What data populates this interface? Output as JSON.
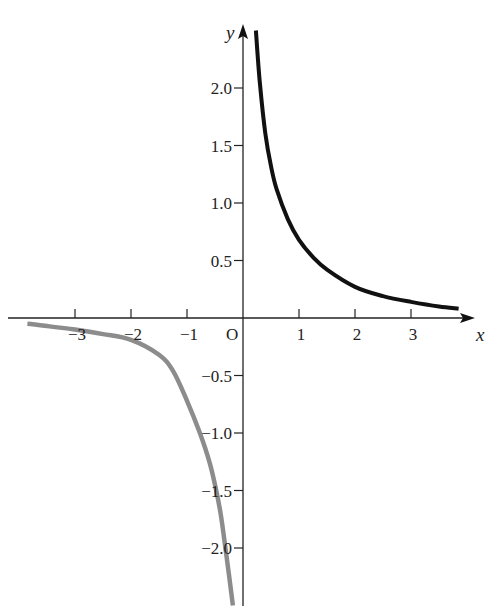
{
  "chart_data": {
    "type": "line",
    "title": "",
    "xlabel": "x",
    "ylabel": "y",
    "origin_label": "O",
    "xlim": [
      -4.3,
      4.3
    ],
    "ylim": [
      -2.5,
      2.5
    ],
    "grid": false,
    "legend": "none",
    "x_ticks": [
      -3,
      -2,
      -1,
      1,
      2,
      3
    ],
    "x_tick_labels": [
      "−3",
      "−2",
      "−1",
      "1",
      "2",
      "3"
    ],
    "y_ticks": [
      2.0,
      1.5,
      1.0,
      0.5,
      -0.5,
      -1.0,
      -1.5,
      -2.0
    ],
    "y_tick_labels": [
      "2.0",
      "1.5",
      "1.0",
      "0.5",
      "−0.5",
      "−1.0",
      "−1.5",
      "−2.0"
    ],
    "series": [
      {
        "name": "positive branch",
        "color": "#111111",
        "x": [
          0.23,
          0.3,
          0.4,
          0.5,
          0.6,
          0.8,
          1.0,
          1.25,
          1.5,
          2.0,
          2.5,
          3.0,
          3.5,
          3.85
        ],
        "y": [
          2.5,
          2.05,
          1.6,
          1.32,
          1.12,
          0.86,
          0.68,
          0.53,
          0.42,
          0.27,
          0.19,
          0.14,
          0.1,
          0.08
        ]
      },
      {
        "name": "negative branch",
        "color": "#8c8c8c",
        "x": [
          -3.85,
          -3.5,
          -3.0,
          -2.5,
          -2.0,
          -1.5,
          -1.25,
          -1.0,
          -0.77,
          -0.6,
          -0.5,
          -0.4,
          -0.3,
          -0.18
        ],
        "y": [
          -0.05,
          -0.07,
          -0.1,
          -0.14,
          -0.19,
          -0.32,
          -0.46,
          -0.72,
          -1.0,
          -1.25,
          -1.45,
          -1.7,
          -2.05,
          -2.5
        ]
      }
    ]
  }
}
